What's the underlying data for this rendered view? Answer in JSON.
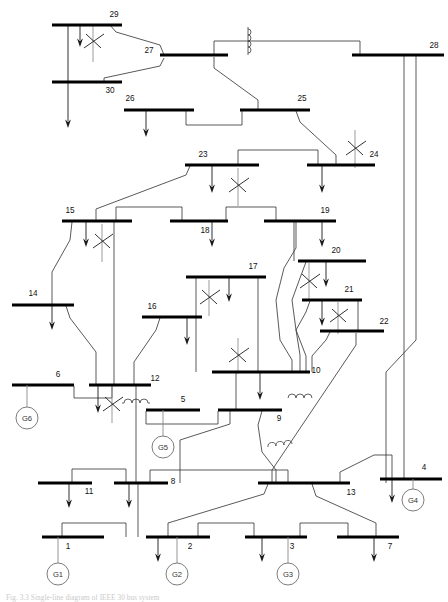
{
  "figure": {
    "caption": "Fig. 3.3  Single-line diagram of IEEE 30 bus system",
    "width": 448,
    "height": 602,
    "background": "#ffffff",
    "bus_color": "#000000",
    "line_color": "#3b3b3b",
    "transformer_color": "#8a8a8a",
    "generator_color": "#6e6e6e"
  },
  "buses": [
    {
      "id": "1",
      "label": "1",
      "x": 42,
      "y": 537,
      "w": 62,
      "label_x": 68,
      "label_y": 549,
      "anchor": "middle"
    },
    {
      "id": "2",
      "label": "2",
      "x": 146,
      "y": 537,
      "w": 64,
      "label_x": 190,
      "label_y": 549,
      "anchor": "middle"
    },
    {
      "id": "3",
      "label": "3",
      "x": 245,
      "y": 537,
      "w": 62,
      "label_x": 292,
      "label_y": 549,
      "anchor": "middle"
    },
    {
      "id": "4",
      "label": "4",
      "x": 380,
      "y": 479,
      "w": 62,
      "label_x": 424,
      "label_y": 470,
      "anchor": "middle"
    },
    {
      "id": "5",
      "label": "5",
      "x": 146,
      "y": 410,
      "w": 54,
      "label_x": 183,
      "label_y": 402,
      "anchor": "middle"
    },
    {
      "id": "6",
      "label": "6",
      "x": 12,
      "y": 385,
      "w": 62,
      "label_x": 58,
      "label_y": 377,
      "anchor": "middle"
    },
    {
      "id": "7",
      "label": "7",
      "x": 337,
      "y": 537,
      "w": 62,
      "label_x": 390,
      "label_y": 549,
      "anchor": "middle"
    },
    {
      "id": "8",
      "label": "8",
      "x": 114,
      "y": 483,
      "w": 54,
      "label_x": 173,
      "label_y": 484,
      "anchor": "middle"
    },
    {
      "id": "9",
      "label": "9",
      "x": 218,
      "y": 410,
      "w": 64,
      "label_x": 279,
      "label_y": 421,
      "anchor": "middle"
    },
    {
      "id": "10",
      "label": "10",
      "x": 212,
      "y": 372,
      "w": 98,
      "label_x": 316,
      "label_y": 373,
      "anchor": "middle"
    },
    {
      "id": "11",
      "label": "11",
      "x": 38,
      "y": 483,
      "w": 54,
      "label_x": 89,
      "label_y": 494,
      "anchor": "middle"
    },
    {
      "id": "12",
      "label": "12",
      "x": 89,
      "y": 385,
      "w": 62,
      "label_x": 155,
      "label_y": 381,
      "anchor": "middle"
    },
    {
      "id": "13",
      "label": "13",
      "x": 258,
      "y": 483,
      "w": 92,
      "label_x": 351,
      "label_y": 495,
      "anchor": "middle"
    },
    {
      "id": "14",
      "label": "14",
      "x": 12,
      "y": 305,
      "w": 62,
      "label_x": 33,
      "label_y": 296,
      "anchor": "middle"
    },
    {
      "id": "15",
      "label": "15",
      "x": 62,
      "y": 221,
      "w": 70,
      "label_x": 70,
      "label_y": 213,
      "anchor": "middle"
    },
    {
      "id": "16",
      "label": "16",
      "x": 142,
      "y": 317,
      "w": 60,
      "label_x": 152,
      "label_y": 309,
      "anchor": "middle"
    },
    {
      "id": "17",
      "label": "17",
      "x": 186,
      "y": 277,
      "w": 80,
      "label_x": 253,
      "label_y": 269,
      "anchor": "middle"
    },
    {
      "id": "18",
      "label": "18",
      "x": 170,
      "y": 221,
      "w": 58,
      "label_x": 205,
      "label_y": 233,
      "anchor": "middle"
    },
    {
      "id": "19",
      "label": "19",
      "x": 264,
      "y": 221,
      "w": 72,
      "label_x": 325,
      "label_y": 213,
      "anchor": "middle"
    },
    {
      "id": "20",
      "label": "20",
      "x": 298,
      "y": 261,
      "w": 68,
      "label_x": 336,
      "label_y": 253,
      "anchor": "middle"
    },
    {
      "id": "21",
      "label": "21",
      "x": 302,
      "y": 300,
      "w": 60,
      "label_x": 349,
      "label_y": 292,
      "anchor": "middle"
    },
    {
      "id": "22",
      "label": "22",
      "x": 320,
      "y": 331,
      "w": 64,
      "label_x": 384,
      "label_y": 324,
      "anchor": "middle"
    },
    {
      "id": "23",
      "label": "23",
      "x": 185,
      "y": 165,
      "w": 74,
      "label_x": 203,
      "label_y": 157,
      "anchor": "middle"
    },
    {
      "id": "24",
      "label": "24",
      "x": 307,
      "y": 165,
      "w": 68,
      "label_x": 374,
      "label_y": 157,
      "anchor": "middle"
    },
    {
      "id": "25",
      "label": "25",
      "x": 240,
      "y": 110,
      "w": 70,
      "label_x": 302,
      "label_y": 101,
      "anchor": "middle"
    },
    {
      "id": "26",
      "label": "26",
      "x": 124,
      "y": 110,
      "w": 70,
      "label_x": 130,
      "label_y": 101,
      "anchor": "middle"
    },
    {
      "id": "27",
      "label": "27",
      "x": 160,
      "y": 55,
      "w": 68,
      "label_x": 149,
      "label_y": 53,
      "anchor": "middle"
    },
    {
      "id": "28",
      "label": "28",
      "x": 352,
      "y": 55,
      "w": 92,
      "label_x": 434,
      "label_y": 48,
      "anchor": "middle"
    },
    {
      "id": "29",
      "label": "29",
      "x": 52,
      "y": 25,
      "w": 70,
      "label_x": 114,
      "label_y": 17,
      "anchor": "middle"
    },
    {
      "id": "30",
      "label": "30",
      "x": 52,
      "y": 82,
      "w": 70,
      "label_x": 110,
      "label_y": 93,
      "anchor": "middle"
    }
  ],
  "generators": [
    {
      "id": "G1",
      "label": "G1",
      "bus": "1",
      "cx": 58,
      "cy": 574,
      "r": 11,
      "lead_from_x": 58,
      "lead_from_y": 537
    },
    {
      "id": "G2",
      "label": "G2",
      "bus": "2",
      "cx": 177,
      "cy": 574,
      "r": 11,
      "lead_from_x": 177,
      "lead_from_y": 537
    },
    {
      "id": "G3",
      "label": "G3",
      "bus": "3",
      "cx": 288,
      "cy": 574,
      "r": 11,
      "lead_from_x": 288,
      "lead_from_y": 537
    },
    {
      "id": "G4",
      "label": "G4",
      "bus": "4",
      "cx": 413,
      "cy": 500,
      "r": 11,
      "lead_from_x": 413,
      "lead_from_y": 479
    },
    {
      "id": "G5",
      "label": "G5",
      "bus": "5",
      "cx": 163,
      "cy": 447,
      "r": 11,
      "lead_from_x": 163,
      "lead_from_y": 410
    },
    {
      "id": "G6",
      "label": "G6",
      "bus": "6",
      "cx": 27,
      "cy": 418,
      "r": 11,
      "lead_from_x": 27,
      "lead_from_y": 385
    }
  ],
  "loads": [
    {
      "bus": "29",
      "x": 80,
      "y1": 25,
      "y2": 47
    },
    {
      "bus": "30",
      "x": 68,
      "y1": 25,
      "y2": 128
    },
    {
      "bus": "26",
      "x": 146,
      "y1": 110,
      "y2": 137
    },
    {
      "bus": "23",
      "x": 212,
      "y1": 165,
      "y2": 193
    },
    {
      "bus": "24",
      "x": 322,
      "y1": 165,
      "y2": 193
    },
    {
      "bus": "15",
      "x": 86,
      "y1": 221,
      "y2": 247
    },
    {
      "bus": "18",
      "x": 212,
      "y1": 221,
      "y2": 247
    },
    {
      "bus": "19",
      "x": 322,
      "y1": 221,
      "y2": 247
    },
    {
      "bus": "20",
      "x": 326,
      "y1": 261,
      "y2": 287
    },
    {
      "bus": "17",
      "x": 229,
      "y1": 277,
      "y2": 302
    },
    {
      "bus": "21",
      "x": 322,
      "y1": 300,
      "y2": 326
    },
    {
      "bus": "14",
      "x": 52,
      "y1": 305,
      "y2": 330
    },
    {
      "bus": "16",
      "x": 187,
      "y1": 317,
      "y2": 345
    },
    {
      "bus": "10",
      "x": 260,
      "y1": 372,
      "y2": 400
    },
    {
      "bus": "12",
      "x": 98,
      "y1": 385,
      "y2": 413
    },
    {
      "bus": "11",
      "x": 69,
      "y1": 483,
      "y2": 508
    },
    {
      "bus": "8",
      "x": 129,
      "y1": 483,
      "y2": 508
    },
    {
      "bus": "4",
      "x": 392,
      "y1": 479,
      "y2": 503
    },
    {
      "bus": "2",
      "x": 158,
      "y1": 537,
      "y2": 562
    },
    {
      "bus": "3",
      "x": 262,
      "y1": 537,
      "y2": 562
    },
    {
      "bus": "7",
      "x": 374,
      "y1": 537,
      "y2": 562
    }
  ],
  "transformers": [
    {
      "id": "T29-27",
      "cx": 93,
      "cy": 42
    },
    {
      "id": "T23",
      "cx": 238,
      "cy": 185
    },
    {
      "id": "T24",
      "cx": 355,
      "cy": 148
    },
    {
      "id": "T15",
      "cx": 102,
      "cy": 240
    },
    {
      "id": "T17",
      "cx": 209,
      "cy": 296
    },
    {
      "id": "T20",
      "cx": 309,
      "cy": 280
    },
    {
      "id": "T21",
      "cx": 338,
      "cy": 315
    },
    {
      "id": "T10",
      "cx": 238,
      "cy": 355
    },
    {
      "id": "T12",
      "cx": 112,
      "cy": 400
    }
  ],
  "shunt_coils": [
    {
      "id": "C28",
      "x": 248,
      "y": 40,
      "orient": "vertical"
    },
    {
      "id": "C12",
      "x": 122,
      "y": 402,
      "orient": "horizontal"
    },
    {
      "id": "C10",
      "x": 286,
      "y": 398,
      "orient": "horizontal"
    },
    {
      "id": "C9",
      "x": 268,
      "y": 443,
      "orient": "horizontal"
    }
  ],
  "legend": {
    "bus_symbol": "thick-horizontal-bar",
    "load_symbol": "down-arrow",
    "generator_symbol": "circle-with-label",
    "transformer_symbol": "slash-through-line",
    "reactor_symbol": "coil"
  }
}
